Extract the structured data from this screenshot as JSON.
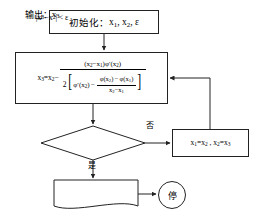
{
  "diagram": {
    "line_color": "#222222",
    "background": "#ffffff",
    "nodes": {
      "init": {
        "shape": "process",
        "label_prefix": "初始化：",
        "label_vars": "x₁, x₂, ε",
        "full_text": "初始化：x₁, x₂, ε"
      },
      "formula": {
        "shape": "process",
        "lhs": "x₃=x₂−",
        "numerator": "(x₂−x₁)φ′(x₂)",
        "coefficient": "2",
        "bracket_left": "[",
        "bracket_right": "]",
        "denom_first": "φ′(x₂) −",
        "denom_frac_num": "φ(x₂) − φ(x₁)",
        "denom_frac_den": "x₂−x₁",
        "full_text": "x₃=x₂− (x₂−x₁)φ′(x₂) / { 2[ φ′(x₂) − (φ(x₂)−φ(x₁))/(x₂−x₁) ] }"
      },
      "decision": {
        "shape": "diamond",
        "condition": "|x₃−x₂| < ε"
      },
      "swap": {
        "shape": "process",
        "assignments": "x₁=x₂ , x₂=x₃"
      },
      "output": {
        "shape": "document",
        "label_prefix": "输出：",
        "label_value": "x₃",
        "full_text": "输出：x₃"
      },
      "stop": {
        "shape": "terminator-circle",
        "label": "停"
      }
    },
    "branches": {
      "no_label": "否",
      "yes_label": "是"
    }
  }
}
